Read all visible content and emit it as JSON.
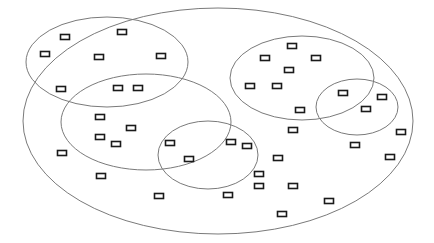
{
  "diagram": {
    "type": "venn-scatter",
    "colors": {
      "background": "#ffffff",
      "ellipse_stroke": "#7a7a7a",
      "rect_stroke": "#1a1a1a",
      "rect_fill": "#ffffff"
    },
    "rect_size": {
      "w": 10,
      "h": 6
    },
    "ellipses": [
      {
        "id": "outer",
        "cx": 218,
        "cy": 121,
        "rx": 195,
        "ry": 113
      },
      {
        "id": "top-left",
        "cx": 107,
        "cy": 62,
        "rx": 81,
        "ry": 45
      },
      {
        "id": "middle-left",
        "cx": 146,
        "cy": 122,
        "rx": 85,
        "ry": 48
      },
      {
        "id": "center-small",
        "cx": 208,
        "cy": 155,
        "rx": 50,
        "ry": 34
      },
      {
        "id": "top-right",
        "cx": 302,
        "cy": 78,
        "rx": 72,
        "ry": 42
      },
      {
        "id": "right-small",
        "cx": 357,
        "cy": 107,
        "rx": 41,
        "ry": 28
      }
    ],
    "points": [
      [
        65,
        37
      ],
      [
        122,
        32
      ],
      [
        45,
        54
      ],
      [
        99,
        57
      ],
      [
        161,
        56
      ],
      [
        61,
        89
      ],
      [
        118,
        88
      ],
      [
        138,
        88
      ],
      [
        100,
        117
      ],
      [
        131,
        128
      ],
      [
        100,
        137
      ],
      [
        116,
        144
      ],
      [
        62,
        153
      ],
      [
        170,
        143
      ],
      [
        189,
        159
      ],
      [
        101,
        176
      ],
      [
        159,
        196
      ],
      [
        231,
        142
      ],
      [
        247,
        146
      ],
      [
        278,
        158
      ],
      [
        259,
        174
      ],
      [
        259,
        186
      ],
      [
        228,
        195
      ],
      [
        293,
        186
      ],
      [
        329,
        201
      ],
      [
        282,
        214
      ],
      [
        292,
        46
      ],
      [
        265,
        58
      ],
      [
        316,
        58
      ],
      [
        289,
        70
      ],
      [
        250,
        86
      ],
      [
        277,
        86
      ],
      [
        300,
        110
      ],
      [
        343,
        93
      ],
      [
        382,
        97
      ],
      [
        366,
        109
      ],
      [
        293,
        130
      ],
      [
        401,
        132
      ],
      [
        355,
        145
      ],
      [
        390,
        157
      ]
    ]
  }
}
